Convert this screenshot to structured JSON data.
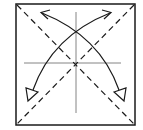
{
  "diagram": {
    "type": "origami-fold-diagram",
    "colors": {
      "line": "#1a1a1a",
      "crease": "#555555",
      "background": "#ffffff"
    },
    "square": {
      "x": 16,
      "y": 4,
      "width": 119,
      "height": 121
    },
    "creases": [
      {
        "name": "vertical-center-crease",
        "x1": 76,
        "y1": 12,
        "x2": 76,
        "y2": 113
      },
      {
        "name": "horizontal-center-crease",
        "x1": 24,
        "y1": 63,
        "x2": 121,
        "y2": 63
      }
    ],
    "valley_folds": [
      {
        "name": "diagonal-tl-br",
        "x1": 17,
        "y1": 5,
        "x2": 134,
        "y2": 124
      },
      {
        "name": "diagonal-tr-bl",
        "x1": 134,
        "y1": 5,
        "x2": 17,
        "y2": 124
      }
    ],
    "arrows": [
      {
        "name": "fold-arrow-bottom-right-to-top-left",
        "path": "M122,94 Q100,36 42,12",
        "head_open": [
          42,
          12
        ],
        "head_hollow": [
          122,
          94
        ]
      },
      {
        "name": "fold-arrow-bottom-left-to-top-right",
        "path": "M30,94 Q52,36 110,12",
        "head_open": [
          110,
          12
        ],
        "head_hollow": [
          30,
          94
        ]
      }
    ]
  }
}
